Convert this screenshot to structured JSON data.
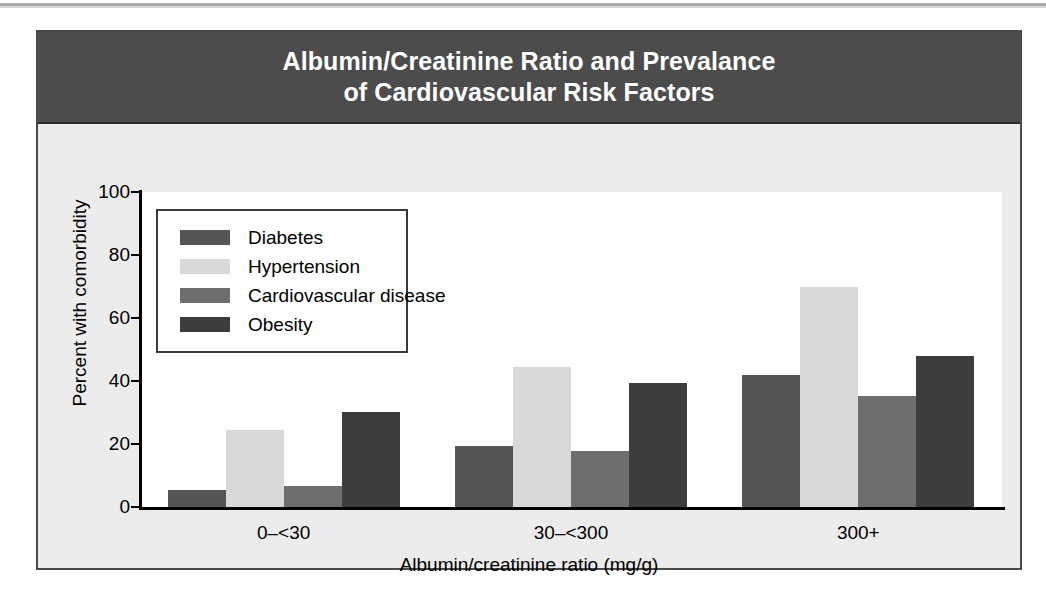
{
  "figure": {
    "title_line1": "Albumin/Creatinine Ratio and Prevalance",
    "title_line2": "of Cardiovascular Risk Factors",
    "title_band_color": "#4c4c4c",
    "panel_color": "#ececec",
    "plot_color": "#ffffff",
    "border_color": "#4a4a4a"
  },
  "chart_data": {
    "type": "bar",
    "title": "Albumin/Creatinine Ratio and Prevalance of Cardiovascular Risk Factors",
    "xlabel": "Albumin/creatinine ratio (mg/g)",
    "ylabel": "Percent with comorbidity",
    "categories": [
      "0–<30",
      "30–<300",
      "300+"
    ],
    "ylim": [
      0,
      100
    ],
    "yticks": [
      0,
      20,
      40,
      60,
      80,
      100
    ],
    "ytick_labels": [
      "0",
      "20",
      "40",
      "60",
      "80",
      "100"
    ],
    "grid": false,
    "legend_position": "upper-left-inside",
    "series": [
      {
        "name": "Diabetes",
        "color": "#555555",
        "values": [
          5.4,
          19.5,
          42.0
        ]
      },
      {
        "name": "Hypertension",
        "color": "#d9d9d9",
        "values": [
          24.4,
          44.3,
          70.0
        ]
      },
      {
        "name": "Cardiovascular disease",
        "color": "#6e6e6e",
        "values": [
          6.8,
          17.8,
          35.4
        ]
      },
      {
        "name": "Obesity",
        "color": "#3d3d3d",
        "values": [
          30.2,
          39.4,
          48.0
        ]
      }
    ]
  }
}
